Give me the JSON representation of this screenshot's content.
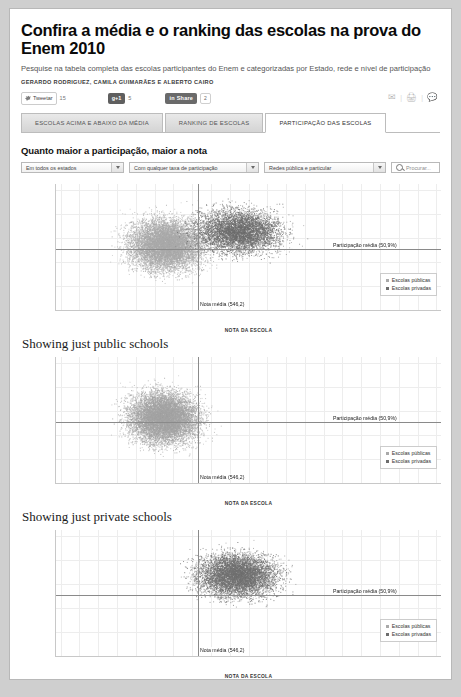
{
  "header": {
    "title": "Confira a média e o ranking das escolas na prova do Enem 2010",
    "subtitle": "Pesquise na tabela completa das escolas participantes do Enem e categorizadas por Estado, rede e nível de participação",
    "byline": "GERARDO RODRIGUEZ, CAMILA GUIMARÃES E ALBERTO CAIRO"
  },
  "social": {
    "twitter_label": "Tweetar",
    "twitter_count": "15",
    "gplus_label": "g+1",
    "gplus_count": "5",
    "linkedin_label": "Share",
    "linkedin_count": "2",
    "mail_icon": "envelope-icon",
    "print_icon": "printer-icon",
    "comment_icon": "comment-icon"
  },
  "tabs": [
    {
      "label": "ESCOLAS ACIMA E ABAIXO DA MÉDIA",
      "active": false
    },
    {
      "label": "RANKING DE ESCOLAS",
      "active": false
    },
    {
      "label": "PARTICIPAÇÃO DAS ESCOLAS",
      "active": true
    }
  ],
  "section_heading": "Quanto maior a participação, maior a nota",
  "controls": {
    "state_filter": "Em todos os estados",
    "rate_filter": "Com qualquer taxa de participação",
    "network_filter": "Redes pública e particular",
    "search_placeholder": "Procurar..."
  },
  "chart_data": [
    {
      "type": "scatter",
      "title": "",
      "xlabel": "NOTA DA ESCOLA",
      "ylabel": "TAXA DE PARTICIPAÇÃO NA PROVA, em %",
      "xlim": [
        395,
        805
      ],
      "ylim": [
        0,
        105
      ],
      "xticks": [
        400,
        420,
        440,
        460,
        480,
        500,
        520,
        540,
        560,
        580,
        600,
        620,
        640,
        660,
        680,
        700,
        720,
        740,
        760,
        780,
        800
      ],
      "yticks": [
        0,
        20,
        40,
        60,
        80,
        100
      ],
      "grid": true,
      "mean_participation": 50.9,
      "mean_score": 546.2,
      "annotations": [
        {
          "text": "Participação média (50,9%)",
          "x": 690,
          "y": 50.9
        },
        {
          "text": "Nota média (546,2)",
          "x": 546.2,
          "y": 5
        }
      ],
      "legend": {
        "position": "bottom-right",
        "entries": [
          "Escolas públicas",
          "Escolas privadas"
        ]
      },
      "series": [
        {
          "name": "Escolas públicas",
          "color": "#a9a9a9",
          "n": 9000,
          "center_x": 512,
          "center_y": 55,
          "spread_x": 42,
          "spread_y": 23
        },
        {
          "name": "Escolas privadas",
          "color": "#6d6d6d",
          "n": 5500,
          "center_x": 590,
          "center_y": 66,
          "spread_x": 48,
          "spread_y": 20
        }
      ]
    },
    {
      "type": "scatter",
      "title": "Showing just public schools",
      "xlabel": "NOTA DA ESCOLA",
      "ylabel": "TAXA DE PARTICIPAÇÃO NA PROVA, em %",
      "xlim": [
        395,
        805
      ],
      "ylim": [
        0,
        105
      ],
      "xticks": [
        400,
        420,
        440,
        460,
        480,
        500,
        520,
        540,
        560,
        580,
        600,
        620,
        640,
        660,
        680,
        700,
        720,
        740,
        760,
        780,
        800
      ],
      "yticks": [
        0,
        20,
        40,
        60,
        80,
        100
      ],
      "grid": true,
      "mean_participation": 50.9,
      "mean_score": 546.2,
      "annotations": [
        {
          "text": "Participação média (50,9%)",
          "x": 690,
          "y": 50.9
        },
        {
          "text": "Nota média (546,2)",
          "x": 546.2,
          "y": 5
        }
      ],
      "legend": {
        "position": "bottom-right",
        "entries": [
          "Escolas públicas",
          "Escolas privadas"
        ]
      },
      "series": [
        {
          "name": "Escolas públicas",
          "color": "#a3a3a3",
          "n": 9500,
          "center_x": 510,
          "center_y": 55,
          "spread_x": 40,
          "spread_y": 23
        }
      ]
    },
    {
      "type": "scatter",
      "title": "Showing just private schools",
      "xlabel": "NOTA DA ESCOLA",
      "ylabel": "TAXA DE PARTICIPAÇÃO NA PROVA, em %",
      "xlim": [
        395,
        805
      ],
      "ylim": [
        0,
        105
      ],
      "xticks": [
        400,
        420,
        440,
        460,
        480,
        500,
        520,
        540,
        560,
        580,
        600,
        620,
        640,
        660,
        680,
        700,
        720,
        740,
        760,
        780,
        800
      ],
      "yticks": [
        0,
        20,
        40,
        60,
        80,
        100
      ],
      "grid": true,
      "mean_participation": 50.9,
      "mean_score": 546.2,
      "annotations": [
        {
          "text": "Participação média (50,9%)",
          "x": 690,
          "y": 50.9
        },
        {
          "text": "Nota média (546,2)",
          "x": 546.2,
          "y": 5
        }
      ],
      "legend": {
        "position": "bottom-right",
        "entries": [
          "Escolas públicas",
          "Escolas privadas"
        ]
      },
      "series": [
        {
          "name": "Escolas privadas",
          "color": "#707070",
          "n": 6500,
          "center_x": 588,
          "center_y": 68,
          "spread_x": 46,
          "spread_y": 19
        }
      ]
    }
  ]
}
